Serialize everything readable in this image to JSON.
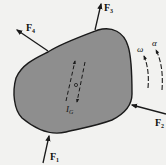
{
  "diagram": {
    "type": "rigid-body-free-body-diagram",
    "colors": {
      "background": "#f2f2f0",
      "body_fill": "#8e8e8e",
      "stroke": "#1a1a1a"
    },
    "body": {
      "center_label": "G",
      "inertia_label": "I",
      "inertia_subscript": "G"
    },
    "forces": [
      {
        "id": "F1",
        "label": "F",
        "subscript": "1",
        "position": "bottom",
        "direction": "up-into-body"
      },
      {
        "id": "F2",
        "label": "F",
        "subscript": "2",
        "position": "right",
        "direction": "left-into-body"
      },
      {
        "id": "F3",
        "label": "F",
        "subscript": "3",
        "position": "top",
        "direction": "up-out-of-body"
      },
      {
        "id": "F4",
        "label": "F",
        "subscript": "4",
        "position": "upper-left",
        "direction": "up-left-out-of-body"
      }
    ],
    "kinematics": {
      "angular_velocity": "ω",
      "angular_acceleration": "α"
    }
  }
}
